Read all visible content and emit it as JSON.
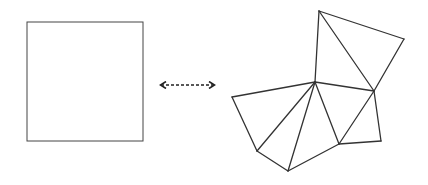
{
  "diagram": {
    "stroke_color": "#333333",
    "background": "#ffffff",
    "square": {
      "x": 27,
      "y": 22,
      "width": 116,
      "height": 119
    },
    "arrow": {
      "x1": 158,
      "x2": 217,
      "y": 85,
      "style": "dashed",
      "heads": "both"
    },
    "net": {
      "vertices": {
        "T": [
          319,
          11
        ],
        "R": [
          404,
          39
        ],
        "C": [
          315,
          82
        ],
        "M": [
          374,
          91
        ],
        "L": [
          232,
          97
        ],
        "BL": [
          257,
          151
        ],
        "B": [
          288,
          171
        ],
        "BM": [
          339,
          144
        ],
        "BR": [
          381,
          141
        ]
      },
      "edges": [
        [
          "T",
          "C"
        ],
        [
          "T",
          "R"
        ],
        [
          "T",
          "M"
        ],
        [
          "R",
          "M"
        ],
        [
          "C",
          "M"
        ],
        [
          "C",
          "L"
        ],
        [
          "L",
          "BL"
        ],
        [
          "C",
          "BL"
        ],
        [
          "BL",
          "B"
        ],
        [
          "C",
          "B"
        ],
        [
          "B",
          "BM"
        ],
        [
          "C",
          "BM"
        ],
        [
          "BM",
          "M"
        ],
        [
          "M",
          "BR"
        ],
        [
          "BR",
          "BM"
        ]
      ]
    }
  }
}
